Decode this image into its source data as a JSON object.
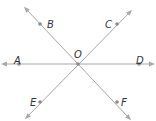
{
  "diagram": {
    "type": "intersecting-lines",
    "center": {
      "label": "O",
      "x": 78,
      "y": 64
    },
    "points": [
      {
        "label": "A",
        "x": 19,
        "y": 64,
        "lx": 14,
        "ly": 60
      },
      {
        "label": "B",
        "x": 40,
        "y": 24,
        "lx": 47,
        "ly": 24
      },
      {
        "label": "C",
        "x": 117,
        "y": 24,
        "lx": 105,
        "ly": 24
      },
      {
        "label": "D",
        "x": 139,
        "y": 64,
        "lx": 136,
        "ly": 60
      },
      {
        "label": "E",
        "x": 40,
        "y": 102,
        "lx": 30,
        "ly": 102
      },
      {
        "label": "F",
        "x": 117,
        "y": 102,
        "lx": 121,
        "ly": 102
      }
    ],
    "lines": [
      {
        "name": "line-AD",
        "x1": 4,
        "y1": 64,
        "x2": 152,
        "y2": 64
      },
      {
        "name": "line-BF",
        "x1": 26,
        "y1": 9,
        "x2": 129,
        "y2": 118
      },
      {
        "name": "line-CE",
        "x1": 130,
        "y1": 12,
        "x2": 27,
        "y2": 117
      }
    ],
    "colors": {
      "line": "#a8a8a8",
      "point": "#8c8c8c",
      "label": "#333333"
    }
  }
}
